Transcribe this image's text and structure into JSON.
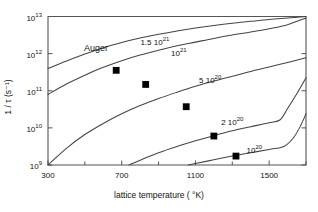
{
  "chart_data": {
    "type": "line",
    "title": "",
    "xlabel": "lattice temperature  ( °K)",
    "ylabel": "1 / τ (s⁻¹)",
    "xlim": [
      300,
      1700
    ],
    "ylim_log10": [
      9,
      13
    ],
    "grid": false,
    "legend_position": "inline-labels",
    "x_ticks": [
      {
        "value": 300,
        "label": "300"
      },
      {
        "value": 700,
        "label": "700"
      },
      {
        "value": 1100,
        "label": "1100"
      },
      {
        "value": 1500,
        "label": "1500"
      }
    ],
    "x_minor_ticks": [
      500,
      900,
      1300,
      1700
    ],
    "y_ticks": [
      {
        "exp": 9,
        "mantissa": "10",
        "exponent": "9"
      },
      {
        "exp": 10,
        "mantissa": "10",
        "exponent": "10"
      },
      {
        "exp": 11,
        "mantissa": "10",
        "exponent": "11"
      },
      {
        "exp": 12,
        "mantissa": "10",
        "exponent": "12"
      },
      {
        "exp": 13,
        "mantissa": "10",
        "exponent": "13"
      }
    ],
    "annotations": [
      {
        "name": "auger-annotation",
        "text": "Auger",
        "x": 560,
        "y_log10": 12.12
      }
    ],
    "series": [
      {
        "name": "n = 1.5e21",
        "label_mantissa": "1.5 10",
        "label_exponent": "21",
        "label_x": 880,
        "label_y_log10": 12.26,
        "points": [
          {
            "x": 300,
            "y_log10": 11.6
          },
          {
            "x": 400,
            "y_log10": 11.8
          },
          {
            "x": 500,
            "y_log10": 11.99
          },
          {
            "x": 600,
            "y_log10": 12.16
          },
          {
            "x": 700,
            "y_log10": 12.3
          },
          {
            "x": 800,
            "y_log10": 12.42
          },
          {
            "x": 900,
            "y_log10": 12.52
          },
          {
            "x": 1000,
            "y_log10": 12.61
          },
          {
            "x": 1100,
            "y_log10": 12.69
          },
          {
            "x": 1200,
            "y_log10": 12.76
          },
          {
            "x": 1300,
            "y_log10": 12.82
          },
          {
            "x": 1400,
            "y_log10": 12.87
          },
          {
            "x": 1500,
            "y_log10": 12.92
          },
          {
            "x": 1600,
            "y_log10": 12.96
          },
          {
            "x": 1700,
            "y_log10": 13.0
          }
        ],
        "markers": [
          {
            "x": 670,
            "y_log10": 11.55
          }
        ]
      },
      {
        "name": "n = 1e21",
        "label_mantissa": "10",
        "label_exponent": "21",
        "label_x": 1010,
        "label_y_log10": 11.95,
        "points": [
          {
            "x": 300,
            "y_log10": 10.9
          },
          {
            "x": 400,
            "y_log10": 11.18
          },
          {
            "x": 500,
            "y_log10": 11.42
          },
          {
            "x": 600,
            "y_log10": 11.63
          },
          {
            "x": 700,
            "y_log10": 11.81
          },
          {
            "x": 800,
            "y_log10": 11.96
          },
          {
            "x": 900,
            "y_log10": 12.09
          },
          {
            "x": 1000,
            "y_log10": 12.21
          },
          {
            "x": 1100,
            "y_log10": 12.31
          },
          {
            "x": 1200,
            "y_log10": 12.41
          },
          {
            "x": 1300,
            "y_log10": 12.5
          },
          {
            "x": 1400,
            "y_log10": 12.58
          },
          {
            "x": 1500,
            "y_log10": 12.67
          },
          {
            "x": 1600,
            "y_log10": 12.78
          },
          {
            "x": 1700,
            "y_log10": 12.96
          }
        ],
        "markers": [
          {
            "x": 830,
            "y_log10": 11.17
          }
        ]
      },
      {
        "name": "n = 5e20",
        "label_mantissa": "5 10",
        "label_exponent": "20",
        "label_x": 1180,
        "label_y_log10": 11.23,
        "points": [
          {
            "x": 300,
            "y_log10": 9.0
          },
          {
            "x": 400,
            "y_log10": 9.45
          },
          {
            "x": 500,
            "y_log10": 9.82
          },
          {
            "x": 600,
            "y_log10": 10.12
          },
          {
            "x": 700,
            "y_log10": 10.38
          },
          {
            "x": 800,
            "y_log10": 10.6
          },
          {
            "x": 900,
            "y_log10": 10.79
          },
          {
            "x": 1000,
            "y_log10": 10.96
          },
          {
            "x": 1100,
            "y_log10": 11.12
          },
          {
            "x": 1200,
            "y_log10": 11.26
          },
          {
            "x": 1300,
            "y_log10": 11.39
          },
          {
            "x": 1400,
            "y_log10": 11.52
          },
          {
            "x": 1500,
            "y_log10": 11.64
          },
          {
            "x": 1600,
            "y_log10": 11.76
          },
          {
            "x": 1700,
            "y_log10": 11.89
          }
        ],
        "markers": [
          {
            "x": 1050,
            "y_log10": 10.57
          }
        ]
      },
      {
        "name": "n = 2e20",
        "label_mantissa": "2 10",
        "label_exponent": "20",
        "label_x": 1300,
        "label_y_log10": 10.1,
        "points": [
          {
            "x": 740,
            "y_log10": 9.0
          },
          {
            "x": 800,
            "y_log10": 9.13
          },
          {
            "x": 900,
            "y_log10": 9.33
          },
          {
            "x": 1000,
            "y_log10": 9.5
          },
          {
            "x": 1100,
            "y_log10": 9.65
          },
          {
            "x": 1200,
            "y_log10": 9.79
          },
          {
            "x": 1300,
            "y_log10": 9.92
          },
          {
            "x": 1400,
            "y_log10": 10.03
          },
          {
            "x": 1500,
            "y_log10": 10.14
          },
          {
            "x": 1560,
            "y_log10": 10.22
          },
          {
            "x": 1600,
            "y_log10": 10.52
          },
          {
            "x": 1650,
            "y_log10": 10.92
          },
          {
            "x": 1700,
            "y_log10": 11.35
          }
        ],
        "markers": [
          {
            "x": 1200,
            "y_log10": 9.78
          }
        ]
      },
      {
        "name": "n = 1e20",
        "label_mantissa": "10",
        "label_exponent": "20",
        "label_x": 1420,
        "label_y_log10": 9.35,
        "points": [
          {
            "x": 1060,
            "y_log10": 9.0
          },
          {
            "x": 1100,
            "y_log10": 9.04
          },
          {
            "x": 1200,
            "y_log10": 9.14
          },
          {
            "x": 1300,
            "y_log10": 9.24
          },
          {
            "x": 1400,
            "y_log10": 9.33
          },
          {
            "x": 1500,
            "y_log10": 9.42
          },
          {
            "x": 1580,
            "y_log10": 9.5
          },
          {
            "x": 1630,
            "y_log10": 9.72
          },
          {
            "x": 1670,
            "y_log10": 10.05
          },
          {
            "x": 1700,
            "y_log10": 10.38
          }
        ],
        "markers": [
          {
            "x": 1320,
            "y_log10": 9.24
          }
        ]
      }
    ]
  }
}
